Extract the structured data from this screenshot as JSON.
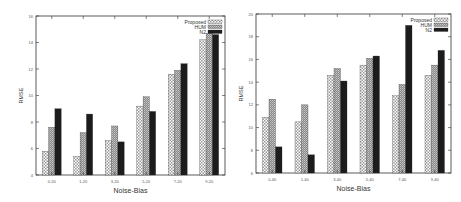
{
  "chart_data": [
    {
      "type": "bar",
      "title": "",
      "xlabel": "Noise-Bias",
      "ylabel": "RMSE",
      "ylim": [
        4,
        16
      ],
      "yticks": [
        4,
        6,
        8,
        10,
        12,
        14,
        16
      ],
      "categories": [
        "0-20",
        "1-20",
        "3-20",
        "5-20",
        "7-20",
        "9-20"
      ],
      "legend_position": "top-right",
      "series": [
        {
          "name": "Proposed",
          "pattern": "checker",
          "values": [
            5.8,
            5.4,
            6.6,
            9.2,
            11.6,
            14.2
          ]
        },
        {
          "name": "HUM",
          "pattern": "dense-gray",
          "values": [
            7.6,
            7.2,
            7.7,
            9.9,
            11.9,
            14.7
          ]
        },
        {
          "name": "N2",
          "pattern": "solid-black",
          "values": [
            9.0,
            8.6,
            6.5,
            8.8,
            12.4,
            14.6
          ]
        }
      ]
    },
    {
      "type": "bar",
      "title": "",
      "xlabel": "Noise-Bias",
      "ylabel": "RMSE",
      "ylim": [
        6,
        20
      ],
      "yticks": [
        6,
        8,
        10,
        12,
        14,
        16,
        18,
        20
      ],
      "categories": [
        "0-40",
        "1-40",
        "3-40",
        "5-40",
        "7-40",
        "9-40"
      ],
      "legend_position": "top-right",
      "series": [
        {
          "name": "Proposed",
          "pattern": "checker",
          "values": [
            10.9,
            10.5,
            14.6,
            15.5,
            12.8,
            14.6
          ]
        },
        {
          "name": "HUM",
          "pattern": "dense-gray",
          "values": [
            12.5,
            12.0,
            15.2,
            16.1,
            13.8,
            15.5
          ]
        },
        {
          "name": "N2",
          "pattern": "solid-black",
          "values": [
            8.3,
            7.6,
            14.1,
            16.3,
            19.0,
            16.8
          ]
        }
      ]
    }
  ],
  "layout": {
    "charts": [
      {
        "left": 36,
        "top": 16,
        "right": 225,
        "bottom": 175
      },
      {
        "left": 256,
        "top": 14,
        "right": 451,
        "bottom": 173
      }
    ]
  }
}
